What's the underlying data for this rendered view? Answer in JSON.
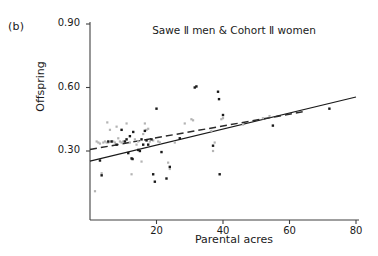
{
  "panel": {
    "label": "(b)"
  },
  "chart_data": {
    "type": "scatter",
    "title": "Sawe Ⅱ men & Cohort Ⅱ women",
    "xlabel": "Parental acres",
    "ylabel": "Offspring",
    "xlim": [
      0,
      80
    ],
    "ylim": [
      0.0,
      0.9
    ],
    "xticks": [
      20,
      40,
      60,
      80
    ],
    "xtick_labels": [
      "20",
      "40",
      "60",
      "80"
    ],
    "yticks": [
      0.3,
      0.6,
      0.9
    ],
    "ytick_labels": [
      "0.30",
      "0.60",
      "0.90"
    ],
    "grid": false,
    "legend": "none",
    "series": [
      {
        "name": "Sawe II men",
        "marker": "square",
        "color": "#1a1a1a",
        "points": [
          [
            3.0,
            0.255
          ],
          [
            3.5,
            0.185
          ],
          [
            5.5,
            0.345
          ],
          [
            6.5,
            0.345
          ],
          [
            8.0,
            0.33
          ],
          [
            9.5,
            0.4
          ],
          [
            10.5,
            0.345
          ],
          [
            11.0,
            0.355
          ],
          [
            11.5,
            0.29
          ],
          [
            12.0,
            0.37
          ],
          [
            12.5,
            0.265
          ],
          [
            12.8,
            0.262
          ],
          [
            13.0,
            0.39
          ],
          [
            14.5,
            0.305
          ],
          [
            15.0,
            0.3
          ],
          [
            15.5,
            0.355
          ],
          [
            16.0,
            0.33
          ],
          [
            16.5,
            0.395
          ],
          [
            17.0,
            0.35
          ],
          [
            17.5,
            0.33
          ],
          [
            18.5,
            0.355
          ],
          [
            19.0,
            0.19
          ],
          [
            19.5,
            0.155
          ],
          [
            20.0,
            0.5
          ],
          [
            21.5,
            0.295
          ],
          [
            23.0,
            0.17
          ],
          [
            24.0,
            0.225
          ],
          [
            27.0,
            0.36
          ],
          [
            31.5,
            0.6
          ],
          [
            32.0,
            0.605
          ],
          [
            37.0,
            0.325
          ],
          [
            38.5,
            0.58
          ],
          [
            38.8,
            0.545
          ],
          [
            39.0,
            0.19
          ],
          [
            40.0,
            0.47
          ],
          [
            55.0,
            0.42
          ],
          [
            72.0,
            0.5
          ]
        ]
      },
      {
        "name": "Cohort II women",
        "marker": "square",
        "color": "#b4b4b4",
        "points": [
          [
            1.5,
            0.11
          ],
          [
            2.0,
            0.345
          ],
          [
            2.5,
            0.34
          ],
          [
            3.0,
            0.335
          ],
          [
            3.5,
            0.195
          ],
          [
            4.0,
            0.34
          ],
          [
            4.5,
            0.345
          ],
          [
            5.0,
            0.34
          ],
          [
            5.2,
            0.435
          ],
          [
            5.5,
            0.34
          ],
          [
            6.0,
            0.4
          ],
          [
            6.5,
            0.345
          ],
          [
            7.0,
            0.345
          ],
          [
            7.5,
            0.34
          ],
          [
            8.0,
            0.415
          ],
          [
            8.5,
            0.36
          ],
          [
            9.0,
            0.345
          ],
          [
            9.5,
            0.34
          ],
          [
            10.0,
            0.345
          ],
          [
            11.0,
            0.43
          ],
          [
            12.0,
            0.34
          ],
          [
            12.5,
            0.19
          ],
          [
            13.5,
            0.355
          ],
          [
            14.0,
            0.33
          ],
          [
            14.5,
            0.345
          ],
          [
            15.5,
            0.25
          ],
          [
            16.0,
            0.38
          ],
          [
            16.5,
            0.43
          ],
          [
            17.0,
            0.4
          ],
          [
            17.5,
            0.405
          ],
          [
            18.0,
            0.345
          ],
          [
            19.0,
            0.35
          ],
          [
            20.5,
            0.345
          ],
          [
            21.0,
            0.34
          ],
          [
            23.5,
            0.245
          ],
          [
            24.0,
            0.215
          ],
          [
            25.5,
            0.34
          ],
          [
            28.5,
            0.43
          ],
          [
            30.5,
            0.45
          ],
          [
            31.0,
            0.445
          ],
          [
            36.5,
            0.395
          ],
          [
            37.0,
            0.3
          ],
          [
            37.5,
            0.34
          ],
          [
            39.5,
            0.45
          ],
          [
            40.0,
            0.455
          ],
          [
            46.0,
            0.425
          ],
          [
            52.0,
            0.455
          ],
          [
            54.0,
            0.465
          ]
        ]
      }
    ],
    "fit_lines": [
      {
        "name": "men-regression",
        "style": "solid",
        "color": "#1a1a1a",
        "x0": 0,
        "y0": 0.252,
        "x1": 80,
        "y1": 0.555
      },
      {
        "name": "women-regression",
        "style": "dashed",
        "color": "#2a2a2a",
        "x0": 0,
        "y0": 0.307,
        "x1": 64,
        "y1": 0.485
      }
    ]
  }
}
